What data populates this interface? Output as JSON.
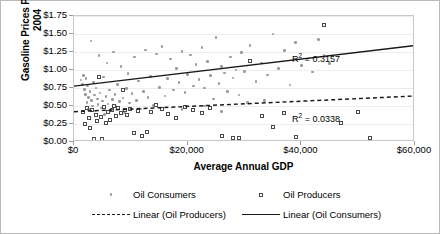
{
  "chart_data": {
    "type": "scatter",
    "title": "",
    "xlabel": "Average Annual GDP",
    "ylabel_line1": "Gasoline Prices Per Liter -",
    "ylabel_line2": "2004",
    "xlim": [
      0,
      60000
    ],
    "ylim": [
      0,
      1.75
    ],
    "xticks": [
      "$0",
      "$20,000",
      "$40,000",
      "$60,000"
    ],
    "xtick_values": [
      0,
      20000,
      40000,
      60000
    ],
    "yticks": [
      "$0.00",
      "$0.25",
      "$0.50",
      "$0.75",
      "$1.00",
      "$1.25",
      "$1.50",
      "$1.75"
    ],
    "ytick_values": [
      0,
      0.25,
      0.5,
      0.75,
      1.0,
      1.25,
      1.5,
      1.75
    ],
    "grid": true,
    "legend_position": "bottom",
    "series": [
      {
        "name": "Oil Consumers",
        "marker": "dot",
        "color": "#9a9a9a",
        "points": [
          [
            1200,
            0.86
          ],
          [
            1500,
            0.8
          ],
          [
            1700,
            0.92
          ],
          [
            1800,
            0.73
          ],
          [
            2000,
            0.66
          ],
          [
            2100,
            0.88
          ],
          [
            2300,
            0.55
          ],
          [
            2400,
            0.78
          ],
          [
            2500,
            0.62
          ],
          [
            2600,
            0.45
          ],
          [
            2800,
            0.7
          ],
          [
            3000,
            1.4
          ],
          [
            3100,
            0.58
          ],
          [
            3300,
            0.5
          ],
          [
            3400,
            0.83
          ],
          [
            3600,
            0.65
          ],
          [
            3700,
            0.43
          ],
          [
            3900,
            0.75
          ],
          [
            4100,
            0.6
          ],
          [
            4200,
            0.52
          ],
          [
            4400,
            1.2
          ],
          [
            4600,
            0.68
          ],
          [
            4800,
            0.47
          ],
          [
            5000,
            0.57
          ],
          [
            5200,
            0.9
          ],
          [
            5400,
            0.38
          ],
          [
            5600,
            0.63
          ],
          [
            5800,
            1.1
          ],
          [
            6000,
            0.53
          ],
          [
            6200,
            0.72
          ],
          [
            6500,
            0.44
          ],
          [
            6800,
            0.59
          ],
          [
            7000,
            1.25
          ],
          [
            7200,
            0.66
          ],
          [
            7400,
            0.49
          ],
          [
            7700,
            0.8
          ],
          [
            8000,
            0.56
          ],
          [
            8300,
            1.05
          ],
          [
            8600,
            0.61
          ],
          [
            8900,
            0.4
          ],
          [
            9200,
            0.74
          ],
          [
            9500,
            0.95
          ],
          [
            9800,
            0.54
          ],
          [
            10200,
            0.67
          ],
          [
            10600,
            1.18
          ],
          [
            11000,
            0.58
          ],
          [
            11400,
            0.85
          ],
          [
            11800,
            0.46
          ],
          [
            12200,
            0.7
          ],
          [
            12600,
            1.28
          ],
          [
            13000,
            0.62
          ],
          [
            13500,
            0.91
          ],
          [
            14000,
            0.51
          ],
          [
            14500,
            1.22
          ],
          [
            15000,
            0.76
          ],
          [
            15500,
            1.33
          ],
          [
            16000,
            0.64
          ],
          [
            16500,
            0.88
          ],
          [
            17000,
            1.15
          ],
          [
            17500,
            0.72
          ],
          [
            18000,
            1.02
          ],
          [
            18500,
            0.83
          ],
          [
            19000,
            1.26
          ],
          [
            19500,
            0.69
          ],
          [
            20000,
            0.94
          ],
          [
            20500,
            1.21
          ],
          [
            21000,
            0.78
          ],
          [
            21500,
            1.08
          ],
          [
            22000,
            0.87
          ],
          [
            22500,
            1.31
          ],
          [
            23000,
            0.75
          ],
          [
            23500,
            1.12
          ],
          [
            24000,
            0.92
          ],
          [
            24500,
            0.6
          ],
          [
            25000,
            1.45
          ],
          [
            25500,
            0.81
          ],
          [
            26000,
            1.05
          ],
          [
            26500,
            0.96
          ],
          [
            27000,
            0.7
          ],
          [
            27500,
            1.18
          ],
          [
            28000,
            0.89
          ],
          [
            28500,
            1.0
          ],
          [
            29000,
            0.65
          ],
          [
            29500,
            1.24
          ],
          [
            30000,
            0.98
          ],
          [
            31000,
            1.34
          ],
          [
            32000,
            0.84
          ],
          [
            33000,
            1.1
          ],
          [
            34000,
            0.93
          ],
          [
            35000,
            1.5
          ],
          [
            36000,
            1.02
          ],
          [
            37000,
            1.27
          ],
          [
            38000,
            0.79
          ],
          [
            39000,
            1.38
          ],
          [
            40000,
            1.06
          ],
          [
            41000,
            1.15
          ],
          [
            42000,
            0.97
          ],
          [
            43000,
            1.42
          ],
          [
            44000,
            1.21
          ],
          [
            45000,
            1.09
          ],
          [
            30500,
            0.55
          ],
          [
            33500,
            0.58
          ],
          [
            23000,
            0.5
          ],
          [
            19000,
            0.45
          ],
          [
            26000,
            0.42
          ]
        ]
      },
      {
        "name": "Oil Producers",
        "marker": "square",
        "color": "#4a4a4a",
        "points": [
          [
            1500,
            0.41
          ],
          [
            2000,
            0.25
          ],
          [
            2300,
            0.47
          ],
          [
            2600,
            0.33
          ],
          [
            2900,
            0.2
          ],
          [
            3200,
            0.44
          ],
          [
            3500,
            0.04
          ],
          [
            3800,
            0.38
          ],
          [
            4100,
            0.29
          ],
          [
            4400,
            0.9
          ],
          [
            4700,
            0.35
          ],
          [
            5000,
            0.04
          ],
          [
            5300,
            0.48
          ],
          [
            5600,
            0.26
          ],
          [
            5900,
            0.42
          ],
          [
            6300,
            0.31
          ],
          [
            6700,
            0.45
          ],
          [
            7000,
            0.5
          ],
          [
            7400,
            0.36
          ],
          [
            7800,
            0.47
          ],
          [
            8200,
            0.4
          ],
          [
            8600,
            0.72
          ],
          [
            9000,
            0.44
          ],
          [
            9400,
            0.38
          ],
          [
            9800,
            0.46
          ],
          [
            10500,
            0.12
          ],
          [
            11200,
            0.43
          ],
          [
            12000,
            0.08
          ],
          [
            12800,
            0.14
          ],
          [
            13500,
            0.41
          ],
          [
            14500,
            0.51
          ],
          [
            15500,
            0.46
          ],
          [
            16500,
            0.39
          ],
          [
            18000,
            0.33
          ],
          [
            19500,
            0.49
          ],
          [
            21000,
            0.44
          ],
          [
            22500,
            0.4
          ],
          [
            24000,
            0.47
          ],
          [
            26000,
            0.08
          ],
          [
            28000,
            0.05
          ],
          [
            29000,
            0.06
          ],
          [
            31000,
            1.12
          ],
          [
            33000,
            0.36
          ],
          [
            35000,
            0.21
          ],
          [
            37000,
            0.4
          ],
          [
            39000,
            0.07
          ],
          [
            44000,
            1.62
          ],
          [
            47000,
            0.26
          ],
          [
            50000,
            0.41
          ],
          [
            52000,
            0.05
          ]
        ]
      }
    ],
    "trendlines": [
      {
        "name": "Linear (Oil Consumers)",
        "style": "solid",
        "color": "#1a1a1a",
        "y_at_xmin": 0.76,
        "y_at_xmax": 1.33,
        "r2_label": "0.3157"
      },
      {
        "name": "Linear (Oil Producers)",
        "style": "dashed",
        "color": "#1a1a1a",
        "y_at_xmin": 0.4,
        "y_at_xmax": 0.62,
        "r2_label": "0.0338"
      }
    ],
    "annotations": [
      {
        "name": "r2-consumers",
        "prefix": "R",
        "sup": "2",
        "text": " = 0.3157"
      },
      {
        "name": "r2-producers",
        "prefix": "R",
        "sup": "2",
        "text": " = 0.0338"
      }
    ],
    "legend": [
      {
        "label": "Oil Consumers",
        "key": "dot"
      },
      {
        "label": "Oil Producers",
        "key": "square"
      },
      {
        "label": "Linear (Oil Producers)",
        "key": "dashed-line"
      },
      {
        "label": "Linear (Oil Consumers)",
        "key": "solid-line"
      }
    ]
  }
}
